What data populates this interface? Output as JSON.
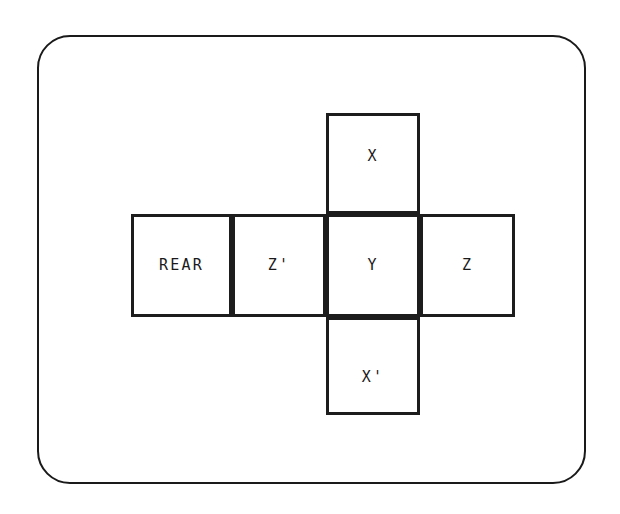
{
  "figure": {
    "type": "cube-net-diagram",
    "frame": {
      "shape": "rounded-rectangle",
      "border_color": "#1a1a1a"
    },
    "faces": [
      {
        "id": "x",
        "label": "X",
        "position": "top"
      },
      {
        "id": "rear",
        "label": "REAR",
        "position": "row-left"
      },
      {
        "id": "zp",
        "label": "Z'",
        "position": "row-center-left"
      },
      {
        "id": "y",
        "label": "Y",
        "position": "row-center"
      },
      {
        "id": "z",
        "label": "Z",
        "position": "row-right"
      },
      {
        "id": "xp",
        "label": "X'",
        "position": "bottom"
      }
    ]
  }
}
